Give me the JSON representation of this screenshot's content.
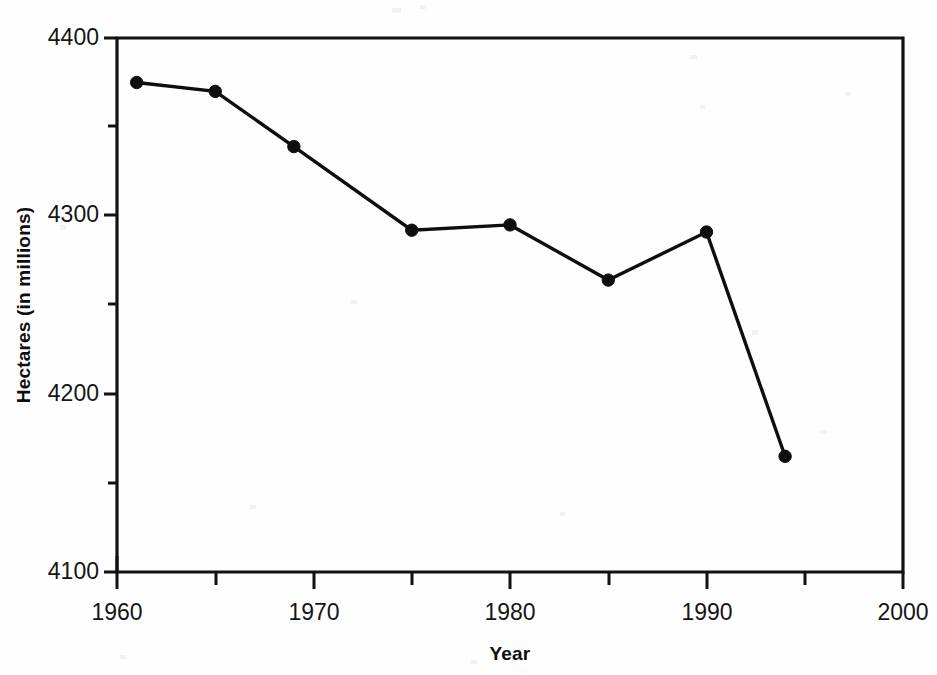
{
  "chart_data": {
    "type": "line",
    "title": "",
    "subtitle": "",
    "xlabel": "Year",
    "ylabel": "Hectares (in millions)",
    "xlim": [
      1960,
      2000
    ],
    "ylim": [
      4100,
      4400
    ],
    "grid": false,
    "legend": false,
    "legend_position": "none",
    "x_tick_labels": [
      "1960",
      "1970",
      "1980",
      "1990",
      "2000"
    ],
    "x_major_ticks": [
      1960,
      1970,
      1980,
      1990,
      2000
    ],
    "x_minor_ticks": [
      1965,
      1975,
      1985,
      1995
    ],
    "y_tick_labels": [
      "4100",
      "4200",
      "4300",
      "4400"
    ],
    "y_major_ticks": [
      4100,
      4200,
      4300,
      4400
    ],
    "y_minor_ticks": [
      4150,
      4250,
      4350
    ],
    "marker": "filled-circle",
    "line_color": "#0e0e0e",
    "series": [
      {
        "name": "Hectares",
        "x": [
          1961,
          1965,
          1969,
          1975,
          1980,
          1985,
          1990,
          1994
        ],
        "values": [
          4375,
          4370,
          4339,
          4292,
          4295,
          4264,
          4291,
          4165
        ]
      }
    ]
  },
  "axes": {
    "x_title": "Year",
    "y_title": "Hectares (in millions)"
  },
  "ticks": {
    "y": [
      {
        "label": "4400",
        "value": 4400
      },
      {
        "label": "4300",
        "value": 4300
      },
      {
        "label": "4200",
        "value": 4200
      },
      {
        "label": "4100",
        "value": 4100
      }
    ],
    "x": [
      {
        "label": "1960",
        "value": 1960
      },
      {
        "label": "1970",
        "value": 1970
      },
      {
        "label": "1980",
        "value": 1980
      },
      {
        "label": "1990",
        "value": 1990
      },
      {
        "label": "2000",
        "value": 2000
      }
    ]
  }
}
